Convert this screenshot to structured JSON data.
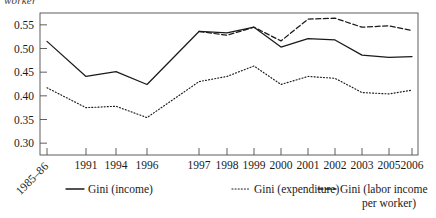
{
  "figure": {
    "cut_off_top_label": "worker",
    "plot_area": {
      "left": 40,
      "top": 13,
      "right": 418,
      "bottom": 155
    }
  },
  "chart_data": {
    "type": "line",
    "title": "",
    "subtitle": "",
    "xlabel": "",
    "ylabel": "",
    "grid": false,
    "legend_position": "bottom",
    "ylim": [
      0.275,
      0.575
    ],
    "ytick_values": [
      0.3,
      0.35,
      0.4,
      0.45,
      0.5,
      0.55
    ],
    "ytick_labels": [
      "0.30",
      "0.35",
      "0.40",
      "0.45",
      "0.50",
      "0.55"
    ],
    "categories": [
      "1985–86",
      "1991",
      "1994",
      "1996",
      "1997",
      "1998",
      "1999",
      "2000",
      "2001",
      "2002",
      "2003",
      "2005",
      "2006"
    ],
    "xtick_labels": [
      "1985–86",
      "1991",
      "1994",
      "1996",
      "1997",
      "1998",
      "1999",
      "2000",
      "2001",
      "2002",
      "2003",
      "2005",
      "2006"
    ],
    "series": [
      {
        "name": "Gini (income)",
        "style": "solid",
        "color": "#1a1a1a",
        "x": [
          "1985–86",
          "1991",
          "1994",
          "1996",
          "1997",
          "1998",
          "1999",
          "2000",
          "2001",
          "2002",
          "2003",
          "2005",
          "2006"
        ],
        "values": [
          0.515,
          0.441,
          0.451,
          0.424,
          0.536,
          0.533,
          0.545,
          0.503,
          0.521,
          0.518,
          0.486,
          0.481,
          0.483
        ]
      },
      {
        "name": "Gini (expenditure)",
        "style": "dotted",
        "color": "#1a1a1a",
        "x": [
          "1985–86",
          "1991",
          "1994",
          "1996",
          "1997",
          "1998",
          "1999",
          "2000",
          "2001",
          "2002",
          "2003",
          "2005",
          "2006"
        ],
        "values": [
          0.417,
          0.375,
          0.378,
          0.354,
          0.43,
          0.441,
          0.463,
          0.424,
          0.441,
          0.437,
          0.407,
          0.404,
          0.412
        ]
      },
      {
        "name": "Gini (labor income per worker)",
        "style": "dashed",
        "color": "#1a1a1a",
        "x": [
          "1997",
          "1998",
          "1999",
          "2000",
          "2001",
          "2002",
          "2003",
          "2005",
          "2006"
        ],
        "values": [
          0.536,
          0.528,
          0.545,
          0.516,
          0.562,
          0.564,
          0.545,
          0.548,
          0.538
        ]
      }
    ]
  },
  "legend": {
    "items": [
      {
        "label": "Gini (income)",
        "style": "solid"
      },
      {
        "label": "Gini (expenditure)",
        "style": "dotted"
      },
      {
        "label": "Gini (labor income",
        "label_line2": "per worker)",
        "style": "dashed"
      }
    ]
  }
}
